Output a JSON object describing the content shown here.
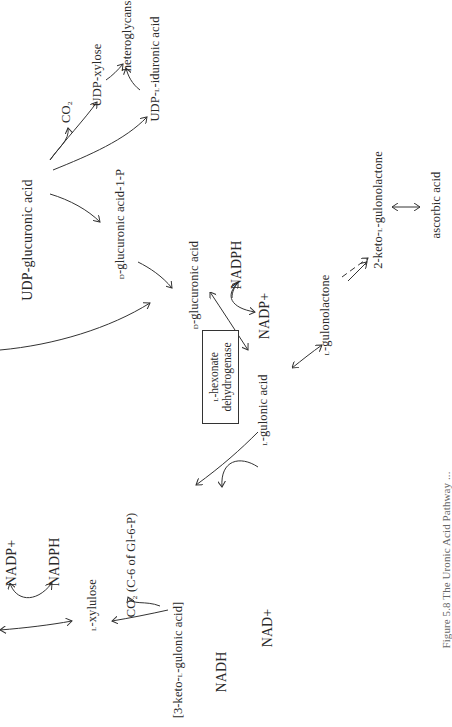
{
  "figure": {
    "orientation": "rotated 90 degrees counter-clockwise",
    "nodes": {
      "udp_glucuronic_acid": "UDP-glucuronic acid",
      "co2_top": "CO₂",
      "udp_xylose": "UDP-xylose",
      "heteroglycans": "heteroglycans",
      "udp_l_iduronic_acid": {
        "prefix": "UDP-",
        "sc": "l",
        "suffix": "-iduronic acid"
      },
      "d_glucuronic_acid_1p": {
        "sc": "d",
        "suffix": "-glucuronic acid-1-P"
      },
      "d_glucuronic_acid": {
        "sc": "d",
        "suffix": "-glucuronic acid"
      },
      "nadph_mid": "NADPH",
      "nadp_plus_mid": "NADP+",
      "l_gulonic_acid": {
        "sc": "l",
        "suffix": "-gulonic acid"
      },
      "l_gulonolactone": {
        "sc": "l",
        "suffix": "-gulonolactone"
      },
      "two_keto_l_gulonolactone": {
        "prefix": "2-keto-",
        "sc": "l",
        "suffix": "-gulonolactone"
      },
      "ascorbic_acid": "ascorbic acid",
      "nadp_plus_bottom": "NADP+",
      "nadph_bottom": "NADPH",
      "l_xylulose": {
        "sc": "l",
        "suffix": "-xylulose"
      },
      "co2_c6": "CO₂ (C-6 of Gl-6-P)",
      "three_keto_l_gulonic_acid": {
        "prefix": "[3-keto-",
        "sc": "l",
        "suffix": "-gulonic acid]"
      },
      "nadh": "NADH",
      "nad_plus": "NAD+"
    },
    "enzyme_box": {
      "line1": {
        "sc": "l",
        "suffix": "-hexonate"
      },
      "line2": "dehydrogenase"
    },
    "caption": "Figure 5.8  The Uronic Acid Pathway ..."
  },
  "colors": {
    "background": "#ffffff",
    "ink": "#2a2a2a"
  }
}
